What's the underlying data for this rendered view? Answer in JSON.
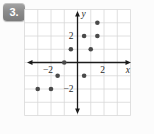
{
  "problem": {
    "number_label": "3."
  },
  "chart_data": {
    "type": "scatter",
    "title": "",
    "xlabel": "x",
    "ylabel": "y",
    "xlim": [
      -4,
      4
    ],
    "ylim": [
      -4,
      4
    ],
    "grid": true,
    "x_ticks": [
      {
        "value": -2,
        "label": "−2"
      },
      {
        "value": 2,
        "label": "2"
      }
    ],
    "y_ticks": [
      {
        "value": -2,
        "label": "−2"
      },
      {
        "value": 2,
        "label": "2"
      }
    ],
    "points": [
      {
        "x": -3,
        "y": -2
      },
      {
        "x": -2,
        "y": -2
      },
      {
        "x": -1.5,
        "y": -1
      },
      {
        "x": -1,
        "y": 0
      },
      {
        "x": -0.5,
        "y": 1
      },
      {
        "x": 0.5,
        "y": -1
      },
      {
        "x": 0.5,
        "y": 2
      },
      {
        "x": 1,
        "y": 1
      },
      {
        "x": 1.5,
        "y": 2
      },
      {
        "x": 1.5,
        "y": 3
      }
    ],
    "colors": {
      "point": "#4a4a4a",
      "axis": "#1c1c1c",
      "grid": "#d8d8d8",
      "panel": "#ffffff",
      "tick_text": "#2a2a2a",
      "badge": "#8c8c8c"
    }
  }
}
